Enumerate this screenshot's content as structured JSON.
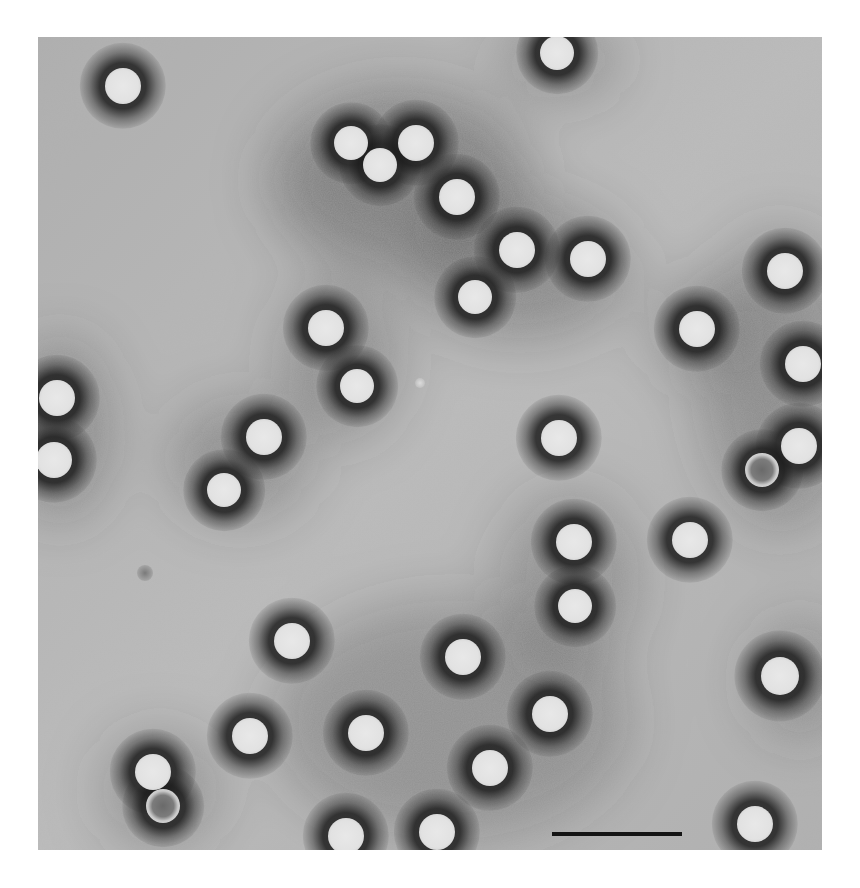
{
  "figure": {
    "type": "negative-stain electron micrograph",
    "background_color": "#b4b4b4",
    "stain_dark_color": "#3c3c3c",
    "particle_fill_color": "#e8e8e8",
    "frame": {
      "x": 38,
      "y": 37,
      "width": 784,
      "height": 813
    }
  },
  "scale_bar": {
    "x1": 552,
    "x2": 682,
    "y": 834,
    "thickness": 4,
    "color": "#141414",
    "label": ""
  },
  "stain_regions": [
    {
      "cx": 400,
      "cy": 180,
      "rx": 130,
      "ry": 90,
      "opacity": 0.45
    },
    {
      "cx": 520,
      "cy": 270,
      "rx": 110,
      "ry": 70,
      "opacity": 0.4
    },
    {
      "cx": 340,
      "cy": 360,
      "rx": 60,
      "ry": 80,
      "opacity": 0.35
    },
    {
      "cx": 240,
      "cy": 460,
      "rx": 70,
      "ry": 60,
      "opacity": 0.35
    },
    {
      "cx": 60,
      "cy": 430,
      "rx": 50,
      "ry": 90,
      "opacity": 0.4
    },
    {
      "cx": 780,
      "cy": 380,
      "rx": 80,
      "ry": 150,
      "opacity": 0.35
    },
    {
      "cx": 570,
      "cy": 580,
      "rx": 70,
      "ry": 90,
      "opacity": 0.3
    },
    {
      "cx": 560,
      "cy": 60,
      "rx": 60,
      "ry": 40,
      "opacity": 0.3
    },
    {
      "cx": 450,
      "cy": 720,
      "rx": 180,
      "ry": 120,
      "opacity": 0.3
    },
    {
      "cx": 160,
      "cy": 790,
      "rx": 60,
      "ry": 60,
      "opacity": 0.3
    },
    {
      "cx": 700,
      "cy": 330,
      "rx": 50,
      "ry": 50,
      "opacity": 0.3
    },
    {
      "cx": 800,
      "cy": 680,
      "rx": 50,
      "ry": 60,
      "opacity": 0.3
    }
  ],
  "particles": [
    {
      "x": 123,
      "y": 86,
      "r": 18,
      "state": "full"
    },
    {
      "x": 557,
      "y": 53,
      "r": 17,
      "state": "full"
    },
    {
      "x": 351,
      "y": 143,
      "r": 17,
      "state": "full"
    },
    {
      "x": 380,
      "y": 165,
      "r": 17,
      "state": "full"
    },
    {
      "x": 416,
      "y": 143,
      "r": 18,
      "state": "full"
    },
    {
      "x": 457,
      "y": 197,
      "r": 18,
      "state": "full"
    },
    {
      "x": 517,
      "y": 250,
      "r": 18,
      "state": "full"
    },
    {
      "x": 588,
      "y": 259,
      "r": 18,
      "state": "full"
    },
    {
      "x": 475,
      "y": 297,
      "r": 17,
      "state": "full"
    },
    {
      "x": 785,
      "y": 271,
      "r": 18,
      "state": "full"
    },
    {
      "x": 697,
      "y": 329,
      "r": 18,
      "state": "full"
    },
    {
      "x": 803,
      "y": 364,
      "r": 18,
      "state": "full"
    },
    {
      "x": 326,
      "y": 328,
      "r": 18,
      "state": "full"
    },
    {
      "x": 357,
      "y": 386,
      "r": 17,
      "state": "full"
    },
    {
      "x": 57,
      "y": 398,
      "r": 18,
      "state": "full"
    },
    {
      "x": 54,
      "y": 460,
      "r": 18,
      "state": "full"
    },
    {
      "x": 264,
      "y": 437,
      "r": 18,
      "state": "full"
    },
    {
      "x": 224,
      "y": 490,
      "r": 17,
      "state": "full"
    },
    {
      "x": 559,
      "y": 438,
      "r": 18,
      "state": "full"
    },
    {
      "x": 799,
      "y": 446,
      "r": 18,
      "state": "full"
    },
    {
      "x": 762,
      "y": 470,
      "r": 17,
      "state": "empty"
    },
    {
      "x": 574,
      "y": 542,
      "r": 18,
      "state": "full"
    },
    {
      "x": 690,
      "y": 540,
      "r": 18,
      "state": "full"
    },
    {
      "x": 575,
      "y": 606,
      "r": 17,
      "state": "full"
    },
    {
      "x": 292,
      "y": 641,
      "r": 18,
      "state": "full"
    },
    {
      "x": 463,
      "y": 657,
      "r": 18,
      "state": "full"
    },
    {
      "x": 780,
      "y": 676,
      "r": 19,
      "state": "full"
    },
    {
      "x": 550,
      "y": 714,
      "r": 18,
      "state": "full"
    },
    {
      "x": 250,
      "y": 736,
      "r": 18,
      "state": "full"
    },
    {
      "x": 366,
      "y": 733,
      "r": 18,
      "state": "full"
    },
    {
      "x": 490,
      "y": 768,
      "r": 18,
      "state": "full"
    },
    {
      "x": 153,
      "y": 772,
      "r": 18,
      "state": "full"
    },
    {
      "x": 163,
      "y": 806,
      "r": 17,
      "state": "empty"
    },
    {
      "x": 346,
      "y": 836,
      "r": 18,
      "state": "full"
    },
    {
      "x": 437,
      "y": 832,
      "r": 18,
      "state": "full"
    },
    {
      "x": 755,
      "y": 824,
      "r": 18,
      "state": "full"
    }
  ],
  "debris": [
    {
      "x": 145,
      "y": 573,
      "r": 8,
      "kind": "small-dark-speck"
    },
    {
      "x": 420,
      "y": 383,
      "r": 5,
      "kind": "small-white-speck"
    }
  ]
}
